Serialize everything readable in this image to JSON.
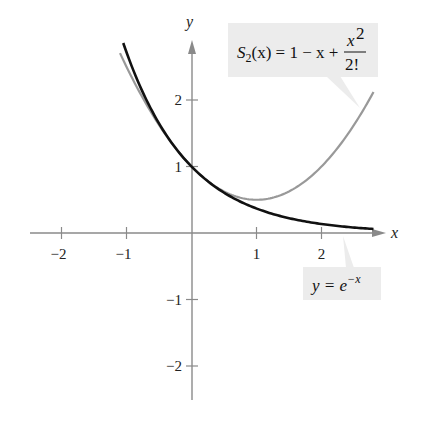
{
  "chart_data": {
    "type": "line",
    "title": "",
    "xlabel": "x",
    "ylabel": "y",
    "xlim": [
      -2.5,
      3.0
    ],
    "ylim": [
      -2.5,
      3.0
    ],
    "grid": false,
    "x_ticks": [
      -2,
      -1,
      1,
      2
    ],
    "y_ticks": [
      -2,
      -1,
      1,
      2
    ],
    "x_tick_labels": [
      "−2",
      "−1",
      "1",
      "2"
    ],
    "y_tick_labels": [
      "−2",
      "−1",
      "1",
      "2"
    ],
    "series": [
      {
        "name": "y = e^(-x)",
        "label_parts": {
          "lhs": "y = e",
          "sup": "−x"
        },
        "color": "#111111",
        "domain": [
          -1.05,
          2.8
        ],
        "x": [
          -1.05,
          -0.5,
          0,
          0.5,
          1,
          1.5,
          2,
          2.5,
          2.8
        ],
        "values": [
          2.86,
          1.65,
          1.0,
          0.61,
          0.37,
          0.22,
          0.14,
          0.08,
          0.06
        ]
      },
      {
        "name": "S2(x) = 1 - x + x^2/2!",
        "label_parts": {
          "S": "S",
          "sub": "2",
          "rest": "(x) = 1 − x + ",
          "num": "x",
          "num_sup": "2",
          "den": "2!"
        },
        "color": "#999999",
        "domain": [
          -1.1,
          2.8
        ],
        "x": [
          -1.1,
          -0.5,
          0,
          0.5,
          1,
          1.5,
          2,
          2.5,
          2.8
        ],
        "values": [
          2.71,
          1.63,
          1.0,
          0.63,
          0.5,
          0.63,
          1.0,
          1.63,
          2.12
        ]
      }
    ],
    "annotations": [
      {
        "text": "S2(x) = 1 − x + x²/2!",
        "points_to": "S2 curve near x=2.55"
      },
      {
        "text": "y = e^(−x)",
        "points_to": "e^(-x) curve near x=2.35"
      }
    ],
    "colors": {
      "axis": "#8a8a8a",
      "callout_bg": "#ececec",
      "exp_curve": "#111111",
      "poly_curve": "#9a9a9a"
    }
  }
}
